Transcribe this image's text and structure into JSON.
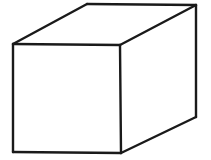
{
  "figure": {
    "shape_name": "cuboid",
    "projection": "oblique-perspective",
    "background_color": "#ffffff",
    "stroke_color": "#1a1a1a",
    "fill_color": "#ffffff",
    "stroke_width": 2.4,
    "canvas": {
      "width": 211,
      "height": 160
    },
    "vertices": {
      "front_top_left": {
        "x": 13,
        "y": 44
      },
      "front_top_right": {
        "x": 120,
        "y": 45
      },
      "front_bottom_right": {
        "x": 121,
        "y": 153
      },
      "front_bottom_left": {
        "x": 13,
        "y": 152
      },
      "back_top_left": {
        "x": 87,
        "y": 4
      },
      "back_top_right": {
        "x": 196,
        "y": 5
      },
      "back_bottom_right": {
        "x": 196,
        "y": 117
      }
    },
    "faces": {
      "front": "13,44 120,45 121,153 13,152",
      "top": "13,44 87,4 196,5 120,45",
      "right": "120,45 196,5 196,117 121,153"
    },
    "edges": [
      {
        "name": "front-top-edge",
        "d": "M13,44 L120,45"
      },
      {
        "name": "front-right-edge",
        "d": "M120,45 L121,153"
      },
      {
        "name": "front-bottom-edge",
        "d": "M121,153 L13,152"
      },
      {
        "name": "front-left-edge",
        "d": "M13,152 L13,44"
      },
      {
        "name": "top-left-receding-edge",
        "d": "M13,44 L87,4"
      },
      {
        "name": "back-top-edge",
        "d": "M87,4 L196,5"
      },
      {
        "name": "top-right-receding-edge",
        "d": "M196,5 L120,45"
      },
      {
        "name": "back-right-vertical-edge",
        "d": "M196,5 L196,117"
      },
      {
        "name": "bottom-right-receding-edge",
        "d": "M196,117 L121,153"
      }
    ],
    "labels": [],
    "annotations": []
  }
}
